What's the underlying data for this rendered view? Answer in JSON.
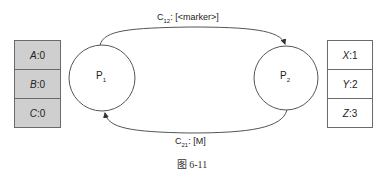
{
  "diagram": {
    "processes": [
      {
        "id": "P1",
        "name": "P",
        "subscript": "1"
      },
      {
        "id": "P2",
        "name": "P",
        "subscript": "2"
      }
    ],
    "state_left": [
      {
        "key": "A",
        "sep": ": ",
        "value": "0"
      },
      {
        "key": "B",
        "sep": ": ",
        "value": "0"
      },
      {
        "key": "C",
        "sep": ": ",
        "value": "0"
      }
    ],
    "state_right": [
      {
        "key": "X",
        "sep": ": ",
        "value": "1"
      },
      {
        "key": "Y",
        "sep": ": ",
        "value": "2"
      },
      {
        "key": "Z",
        "sep": ": ",
        "value": "3"
      }
    ],
    "channels": [
      {
        "name": "C",
        "subscript": "12",
        "content": ": [<marker>]",
        "from": "P1",
        "to": "P2"
      },
      {
        "name": "C",
        "subscript": "21",
        "content": ": [M]",
        "from": "P2",
        "to": "P1"
      }
    ],
    "caption": "图 6-11",
    "colors": {
      "left_state_fill": "#cfcfcf",
      "right_state_fill": "#ffffff",
      "stroke": "#555555"
    }
  }
}
